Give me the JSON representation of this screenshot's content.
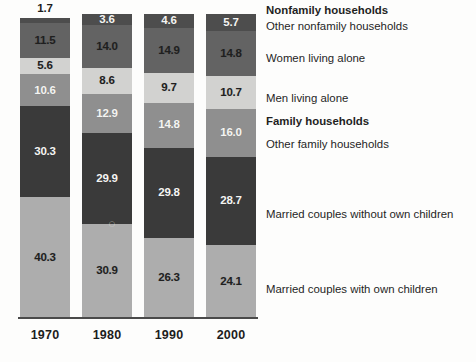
{
  "chart_data": {
    "type": "bar",
    "subtype": "stacked-percentage-column",
    "title": "",
    "xlabel": "",
    "ylabel": "",
    "ylim": [
      0,
      100
    ],
    "grid": false,
    "legend_position": "right",
    "categories": [
      "1970",
      "1980",
      "1990",
      "2000"
    ],
    "series": [
      {
        "name": "Married couples with own children",
        "color": "#adadad",
        "label_color": "dark",
        "values": [
          40.3,
          30.9,
          26.3,
          24.1
        ]
      },
      {
        "name": "Married couples without own children",
        "color": "#3a3a3a",
        "label_color": "light",
        "values": [
          30.3,
          29.9,
          29.8,
          28.7
        ]
      },
      {
        "name": "Other family households",
        "color": "#8f8f8f",
        "label_color": "light",
        "values": [
          10.6,
          12.9,
          14.8,
          16.0
        ]
      },
      {
        "name": "Men living alone",
        "color": "#d2d2d0",
        "label_color": "dark",
        "values": [
          5.6,
          8.6,
          9.7,
          10.7
        ]
      },
      {
        "name": "Women living alone",
        "color": "#636363",
        "label_color": "dark",
        "values": [
          11.5,
          14.0,
          14.9,
          14.8
        ]
      },
      {
        "name": "Other nonfamily households",
        "color": "#4d4d4d",
        "label_color": "light",
        "values": [
          1.7,
          3.6,
          4.6,
          5.7
        ]
      }
    ]
  },
  "bars": {
    "b1970": {
      "year": "1970",
      "top_caption": "1.7",
      "segments": [
        {
          "key": "other-nonfamily",
          "value": "1.7",
          "show_inline": false
        },
        {
          "key": "women-alone",
          "value": "11.5",
          "show_inline": true
        },
        {
          "key": "men-alone",
          "value": "5.6",
          "show_inline": true
        },
        {
          "key": "other-family",
          "value": "10.6",
          "show_inline": true
        },
        {
          "key": "married-no-children",
          "value": "30.3",
          "show_inline": true
        },
        {
          "key": "married-with-children",
          "value": "40.3",
          "show_inline": true
        }
      ]
    },
    "b1980": {
      "year": "1980",
      "top_caption": "",
      "segments": [
        {
          "key": "other-nonfamily",
          "value": "3.6",
          "show_inline": true
        },
        {
          "key": "women-alone",
          "value": "14.0",
          "show_inline": true
        },
        {
          "key": "men-alone",
          "value": "8.6",
          "show_inline": true
        },
        {
          "key": "other-family",
          "value": "12.9",
          "show_inline": true
        },
        {
          "key": "married-no-children",
          "value": "29.9",
          "show_inline": true
        },
        {
          "key": "married-with-children",
          "value": "30.9",
          "show_inline": true
        }
      ]
    },
    "b1990": {
      "year": "1990",
      "top_caption": "",
      "segments": [
        {
          "key": "other-nonfamily",
          "value": "4.6",
          "show_inline": true
        },
        {
          "key": "women-alone",
          "value": "14.9",
          "show_inline": true
        },
        {
          "key": "men-alone",
          "value": "9.7",
          "show_inline": true
        },
        {
          "key": "other-family",
          "value": "14.8",
          "show_inline": true
        },
        {
          "key": "married-no-children",
          "value": "29.8",
          "show_inline": true
        },
        {
          "key": "married-with-children",
          "value": "26.3",
          "show_inline": true
        }
      ]
    },
    "b2000": {
      "year": "2000",
      "top_caption": "",
      "segments": [
        {
          "key": "other-nonfamily",
          "value": "5.7",
          "show_inline": true
        },
        {
          "key": "women-alone",
          "value": "14.8",
          "show_inline": true
        },
        {
          "key": "men-alone",
          "value": "10.7",
          "show_inline": true
        },
        {
          "key": "other-family",
          "value": "16.0",
          "show_inline": true
        },
        {
          "key": "married-no-children",
          "value": "28.7",
          "show_inline": true
        },
        {
          "key": "married-with-children",
          "value": "24.1",
          "show_inline": true
        }
      ]
    }
  },
  "axis": {
    "ticks": [
      "1970",
      "1980",
      "1990",
      "2000"
    ]
  },
  "legend": {
    "entries": [
      {
        "label": "Nonfamily households",
        "bold": true,
        "top": 4
      },
      {
        "label": "Other nonfamily households",
        "bold": false,
        "top": 20
      },
      {
        "label": "Women living alone",
        "bold": false,
        "top": 52
      },
      {
        "label": "Men living alone",
        "bold": false,
        "top": 92
      },
      {
        "label": "Family households",
        "bold": true,
        "top": 115
      },
      {
        "label": "Other family households",
        "bold": false,
        "top": 138
      },
      {
        "label": "Married couples without own children",
        "bold": false,
        "top": 208
      },
      {
        "label": "Married couples with own children",
        "bold": false,
        "top": 283
      }
    ]
  },
  "artifact": {
    "glyph": "○"
  }
}
